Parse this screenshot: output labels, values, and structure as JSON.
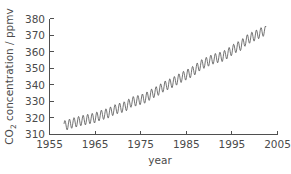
{
  "chart_data": {
    "type": "line",
    "title": "",
    "subtitle": "",
    "xlabel": "year",
    "ylabel": "CO2 concentration / ppmv",
    "ylabel_parts": {
      "prefix": "CO",
      "subscript": "2",
      "suffix": " concentration / ppmv"
    },
    "xlim": [
      1955,
      2005
    ],
    "ylim": [
      310,
      380
    ],
    "xticks": [
      1955,
      1965,
      1975,
      1985,
      1995,
      2005
    ],
    "xtick_labels": [
      "1955",
      "1965",
      "1975",
      "1985",
      "1995",
      "2005"
    ],
    "yticks": [
      310,
      320,
      330,
      340,
      350,
      360,
      370,
      380
    ],
    "ytick_labels": [
      "310",
      "320",
      "330",
      "340",
      "350",
      "360",
      "370",
      "380"
    ],
    "grid": false,
    "legend": null,
    "legend_position": "none",
    "line_color": "#454545",
    "axis_color": "#4f4f4f",
    "series": [
      {
        "name": "Mauna Loa monthly mean CO2",
        "description": "Keeling Curve: rising annual-mean CO2 with a seasonal sawtooth of roughly 6 ppmv peak-to-trough, peak in May and minimum in September-October.",
        "seasonal_amplitude_ppmv": 6.0,
        "seasonal_peak_month": 5,
        "seasonal_trough_month": 10,
        "x": [
          1958.2,
          1959,
          1960,
          1961,
          1962,
          1963,
          1964,
          1965,
          1966,
          1967,
          1968,
          1969,
          1970,
          1971,
          1972,
          1973,
          1974,
          1975,
          1976,
          1977,
          1978,
          1979,
          1980,
          1981,
          1982,
          1983,
          1984,
          1985,
          1986,
          1987,
          1988,
          1989,
          1990,
          1991,
          1992,
          1993,
          1994,
          1995,
          1996,
          1997,
          1998,
          1999,
          2000,
          2001,
          2002
        ],
        "annual_mean_values": [
          315.3,
          315.9,
          316.9,
          317.6,
          318.4,
          318.9,
          319.6,
          320.0,
          321.4,
          322.2,
          323.0,
          324.6,
          325.7,
          326.3,
          327.5,
          329.7,
          330.2,
          331.1,
          332.0,
          333.8,
          335.4,
          336.8,
          338.8,
          340.1,
          341.4,
          343.0,
          344.6,
          346.0,
          347.4,
          349.2,
          351.6,
          353.1,
          354.4,
          355.6,
          356.4,
          357.1,
          358.8,
          360.8,
          362.6,
          363.8,
          366.6,
          368.3,
          369.5,
          371.0,
          372.4
        ]
      }
    ]
  },
  "axes": {
    "x_axis_name": "year-axis",
    "y_axis_name": "co2-concentration-axis"
  }
}
